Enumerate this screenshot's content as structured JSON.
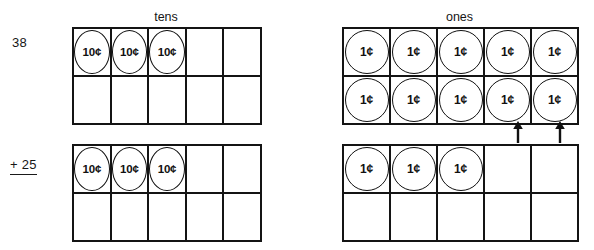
{
  "problem": {
    "addend_1": "38",
    "addend_2_sign": "+",
    "addend_2": "25"
  },
  "headings": {
    "tens": "tens",
    "ones": "ones"
  },
  "coins": {
    "dime_label": "10¢",
    "penny_label": "1¢"
  },
  "frames": {
    "tens_top": {
      "name": "tens-frame-addend-1",
      "rows": 2,
      "cols": 5,
      "cells": [
        {
          "coin": "10¢"
        },
        {
          "coin": "10¢"
        },
        {
          "coin": "10¢"
        },
        {
          "coin": ""
        },
        {
          "coin": ""
        },
        {
          "coin": ""
        },
        {
          "coin": ""
        },
        {
          "coin": ""
        },
        {
          "coin": ""
        },
        {
          "coin": ""
        }
      ]
    },
    "ones_top": {
      "name": "ones-frame-addend-1",
      "rows": 2,
      "cols": 5,
      "cells": [
        {
          "coin": "1¢"
        },
        {
          "coin": "1¢"
        },
        {
          "coin": "1¢"
        },
        {
          "coin": "1¢"
        },
        {
          "coin": "1¢"
        },
        {
          "coin": "1¢"
        },
        {
          "coin": "1¢"
        },
        {
          "coin": "1¢"
        },
        {
          "coin": "1¢"
        },
        {
          "coin": "1¢"
        }
      ]
    },
    "tens_bottom": {
      "name": "tens-frame-addend-2",
      "rows": 2,
      "cols": 5,
      "cells": [
        {
          "coin": "10¢"
        },
        {
          "coin": "10¢"
        },
        {
          "coin": "10¢"
        },
        {
          "coin": ""
        },
        {
          "coin": ""
        },
        {
          "coin": ""
        },
        {
          "coin": ""
        },
        {
          "coin": ""
        },
        {
          "coin": ""
        },
        {
          "coin": ""
        }
      ]
    },
    "ones_bottom": {
      "name": "ones-frame-addend-2",
      "rows": 2,
      "cols": 5,
      "cells": [
        {
          "coin": "1¢"
        },
        {
          "coin": "1¢"
        },
        {
          "coin": "1¢"
        },
        {
          "coin": ""
        },
        {
          "coin": ""
        },
        {
          "coin": ""
        },
        {
          "coin": ""
        },
        {
          "coin": ""
        },
        {
          "coin": ""
        },
        {
          "coin": ""
        }
      ]
    }
  },
  "arrows": [
    {
      "name": "carry-arrow-ones-column-4",
      "direction": "up"
    },
    {
      "name": "carry-arrow-ones-column-5",
      "direction": "up"
    }
  ],
  "colors": {
    "ink": "#141414",
    "background": "#ffffff"
  }
}
